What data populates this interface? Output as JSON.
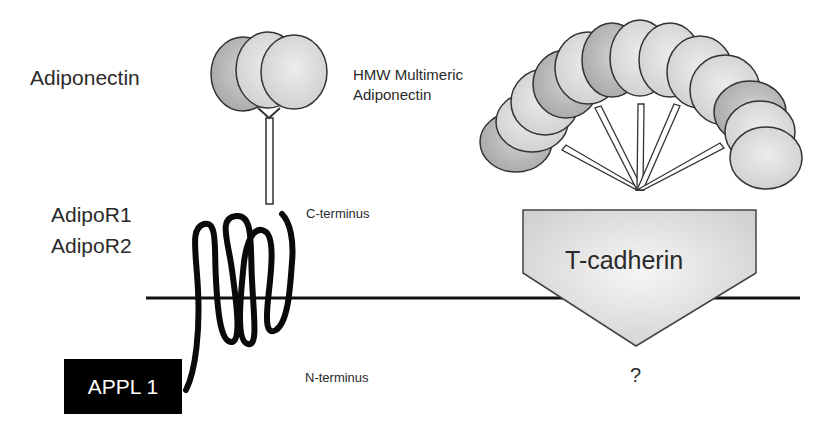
{
  "labels": {
    "adiponectin": "Adiponectin",
    "hmw_line1": "HMW Multimeric",
    "hmw_line2": "Adiponectin",
    "adipor1": "AdipoR1",
    "adipor2": "AdipoR2",
    "c_terminus": "C-terminus",
    "n_terminus": "N-terminus",
    "appl1": "APPL 1",
    "t_cadherin": "T-cadherin",
    "unknown": "?"
  },
  "colors": {
    "membrane": "#111111",
    "globule_fill_light": "#e4e4e4",
    "globule_fill_dark": "#b8b8b8",
    "outline": "#333333",
    "appl_box": "#000000",
    "cadherin_fill": "#e8e8e8"
  }
}
